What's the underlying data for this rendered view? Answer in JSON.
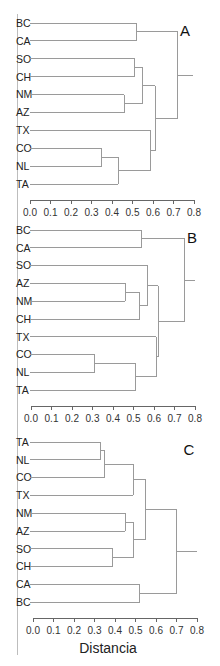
{
  "figure": {
    "axis_title": "Distancia",
    "tick_labels": [
      "0.0",
      "0.1",
      "0.2",
      "0.3",
      "0.4",
      "0.5",
      "0.6",
      "0.7",
      "0.8"
    ]
  },
  "chart_data": [
    {
      "type": "dendrogram",
      "panel": "A",
      "title": "A",
      "xlabel": "",
      "xlim": [
        0.0,
        0.8
      ],
      "leaves": [
        "BC",
        "CA",
        "SO",
        "CH",
        "NM",
        "AZ",
        "TX",
        "CO",
        "NL",
        "TA"
      ],
      "merges": [
        {
          "members": [
            "CO",
            "NL"
          ],
          "height": 0.35
        },
        {
          "members": [
            "CO-NL",
            "TA"
          ],
          "height": 0.43
        },
        {
          "members": [
            "NM",
            "AZ"
          ],
          "height": 0.46
        },
        {
          "members": [
            "SO",
            "CH"
          ],
          "height": 0.51
        },
        {
          "members": [
            "BC",
            "CA"
          ],
          "height": 0.52
        },
        {
          "members": [
            "SO-CH",
            "NM-AZ"
          ],
          "height": 0.55
        },
        {
          "members": [
            "TX",
            "CO-NL-TA"
          ],
          "height": 0.59
        },
        {
          "members": [
            "SO-CH-NM-AZ",
            "TX-CO-NL-TA"
          ],
          "height": 0.61
        },
        {
          "members": [
            "BC-CA",
            "rest"
          ],
          "height": 0.72
        }
      ]
    },
    {
      "type": "dendrogram",
      "panel": "B",
      "title": "B",
      "xlabel": "",
      "xlim": [
        0.0,
        0.8
      ],
      "leaves": [
        "BC",
        "CA",
        "SO",
        "AZ",
        "NM",
        "CH",
        "TX",
        "CO",
        "NL",
        "TA"
      ],
      "merges": [
        {
          "members": [
            "CO",
            "NL"
          ],
          "height": 0.31
        },
        {
          "members": [
            "AZ",
            "NM"
          ],
          "height": 0.46
        },
        {
          "members": [
            "CO-NL",
            "TA"
          ],
          "height": 0.51
        },
        {
          "members": [
            "AZ-NM",
            "CH"
          ],
          "height": 0.53
        },
        {
          "members": [
            "BC",
            "CA"
          ],
          "height": 0.54
        },
        {
          "members": [
            "SO",
            "AZ-NM-CH"
          ],
          "height": 0.57
        },
        {
          "members": [
            "TX",
            "CO-NL-TA"
          ],
          "height": 0.61
        },
        {
          "members": [
            "SO-AZ-NM-CH",
            "TX-CO-NL-TA"
          ],
          "height": 0.62
        },
        {
          "members": [
            "BC-CA",
            "rest"
          ],
          "height": 0.75
        }
      ]
    },
    {
      "type": "dendrogram",
      "panel": "C",
      "title": "C",
      "xlabel": "Distancia",
      "xlim": [
        0.0,
        0.8
      ],
      "leaves": [
        "TA",
        "NL",
        "CO",
        "TX",
        "NM",
        "AZ",
        "SO",
        "CH",
        "CA",
        "BC"
      ],
      "merges": [
        {
          "members": [
            "TA",
            "NL"
          ],
          "height": 0.33
        },
        {
          "members": [
            "TA-NL",
            "CO"
          ],
          "height": 0.35
        },
        {
          "members": [
            "SO",
            "CH"
          ],
          "height": 0.39
        },
        {
          "members": [
            "NM",
            "AZ"
          ],
          "height": 0.45
        },
        {
          "members": [
            "TA-NL-CO",
            "TX"
          ],
          "height": 0.49
        },
        {
          "members": [
            "NM-AZ",
            "SO-CH"
          ],
          "height": 0.49
        },
        {
          "members": [
            "CA",
            "BC"
          ],
          "height": 0.52
        },
        {
          "members": [
            "TA-NL-CO-TX",
            "NM-AZ-SO-CH"
          ],
          "height": 0.55
        },
        {
          "members": [
            "rest",
            "CA-BC"
          ],
          "height": 0.7
        }
      ]
    }
  ]
}
